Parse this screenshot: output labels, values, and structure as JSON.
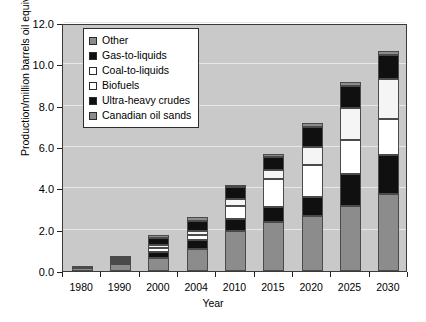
{
  "chart_data": {
    "type": "bar",
    "subtype": "stacked-vertical",
    "title": "",
    "xlabel": "Year",
    "ylabel": "Production/million barrels oil equivalent per day",
    "categories": [
      "1980",
      "1990",
      "2000",
      "2004",
      "2010",
      "2015",
      "2020",
      "2025",
      "2030"
    ],
    "ylim": [
      0.0,
      12.0
    ],
    "yticks": [
      "0.0",
      "2.0",
      "4.0",
      "6.0",
      "8.0",
      "10.0",
      "12.0"
    ],
    "ytick_values": [
      0,
      2,
      4,
      6,
      8,
      10,
      12
    ],
    "grid": true,
    "legend_position": "top-left-inside",
    "series": [
      {
        "name": "Canadian oil sands",
        "color": "#8c8c8c",
        "values": [
          0.15,
          0.35,
          0.65,
          1.05,
          1.95,
          2.35,
          2.65,
          3.15,
          3.75
        ]
      },
      {
        "name": "Ultra-heavy crudes",
        "color": "#101010",
        "values": [
          0.0,
          0.05,
          0.25,
          0.45,
          0.55,
          0.75,
          0.95,
          1.55,
          1.85
        ]
      },
      {
        "name": "Biofuels",
        "color": "#ffffff",
        "values": [
          0.0,
          0.1,
          0.2,
          0.25,
          0.65,
          1.35,
          1.55,
          1.65,
          1.75
        ]
      },
      {
        "name": "Coal-to-liquids",
        "color": "#f5f5f5",
        "values": [
          0.0,
          0.1,
          0.15,
          0.2,
          0.35,
          0.45,
          0.85,
          1.55,
          1.95
        ]
      },
      {
        "name": "Gas-to-liquids",
        "color": "#101010",
        "values": [
          0.0,
          0.05,
          0.35,
          0.45,
          0.55,
          0.6,
          0.95,
          1.05,
          1.15
        ]
      },
      {
        "name": "Other",
        "color": "#8c8c8c",
        "values": [
          0.05,
          0.1,
          0.15,
          0.2,
          0.1,
          0.15,
          0.2,
          0.2,
          0.2
        ]
      }
    ],
    "totals": [
      0.2,
      0.75,
      1.75,
      2.6,
      4.15,
      5.65,
      7.15,
      9.15,
      10.65
    ]
  },
  "legend": {
    "items": [
      {
        "label": "Other",
        "color": "#8c8c8c"
      },
      {
        "label": "Gas-to-liquids",
        "color": "#101010"
      },
      {
        "label": "Coal-to-liquids",
        "color": "#ffffff"
      },
      {
        "label": "Biofuels",
        "color": "#ffffff"
      },
      {
        "label": "Ultra-heavy crudes",
        "color": "#101010"
      },
      {
        "label": "Canadian oil sands",
        "color": "#8c8c8c"
      }
    ]
  },
  "axes": {
    "x_title": "Year",
    "y_title": "Production/million barrels oil equivalent per day"
  },
  "colors": {
    "plot_background": "#c9c9c9",
    "gridline": "#e8e8e8",
    "axis": "#3a3a3a",
    "page_background": "#ffffff"
  }
}
